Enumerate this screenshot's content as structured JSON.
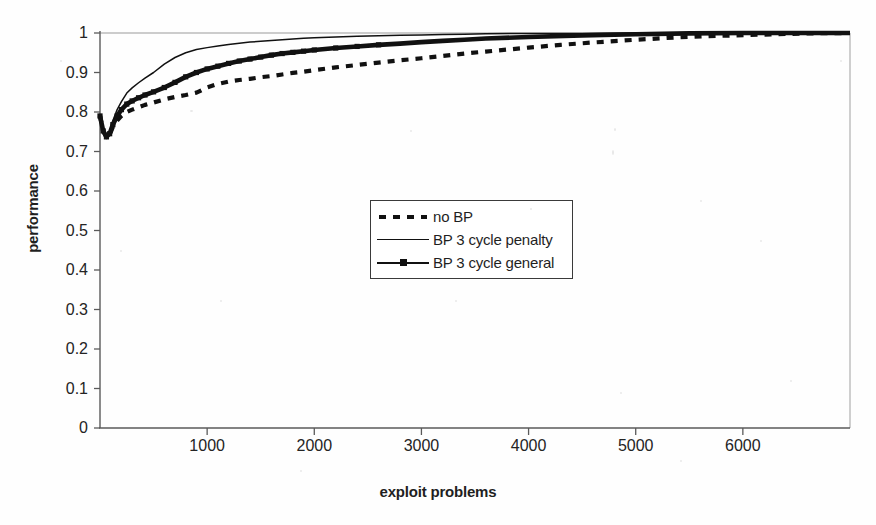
{
  "chart_data": {
    "type": "line",
    "title": "",
    "subtitle": "",
    "xlabel": "exploit problems",
    "ylabel": "performance",
    "xlim": [
      0,
      7000
    ],
    "ylim": [
      0,
      1
    ],
    "xticks": [
      1000,
      2000,
      3000,
      4000,
      5000,
      6000
    ],
    "xtick_labels": [
      "1000",
      "2000",
      "3000",
      "4000",
      "5000",
      "6000"
    ],
    "yticks": [
      0,
      0.1,
      0.2,
      0.3,
      0.4,
      0.5,
      0.6,
      0.7,
      0.8,
      0.9,
      1
    ],
    "ytick_labels": [
      "0",
      "0.1",
      "0.2",
      "0.3",
      "0.4",
      "0.5",
      "0.6",
      "0.7",
      "0.8",
      "0.9",
      "1"
    ],
    "grid": false,
    "legend_position": "center",
    "legend_entries": [
      "no BP",
      "BP 3 cycle penalty",
      "BP 3 cycle general"
    ],
    "series": [
      {
        "name": "no BP",
        "style": "dashed",
        "color": "#111111",
        "x": [
          0,
          30,
          60,
          90,
          120,
          160,
          200,
          250,
          300,
          360,
          420,
          500,
          600,
          700,
          800,
          900,
          1000,
          1100,
          1200,
          1300,
          1400,
          1500,
          1600,
          1700,
          1800,
          1900,
          2000,
          2200,
          2400,
          2600,
          2800,
          3000,
          3200,
          3400,
          3600,
          3800,
          4000,
          4300,
          4600,
          5000,
          5400,
          5800,
          6200,
          6600,
          7000
        ],
        "y": [
          0.79,
          0.752,
          0.737,
          0.742,
          0.762,
          0.778,
          0.79,
          0.8,
          0.806,
          0.812,
          0.818,
          0.824,
          0.832,
          0.838,
          0.843,
          0.849,
          0.862,
          0.871,
          0.877,
          0.881,
          0.884,
          0.888,
          0.891,
          0.895,
          0.899,
          0.902,
          0.906,
          0.913,
          0.919,
          0.925,
          0.931,
          0.936,
          0.942,
          0.948,
          0.953,
          0.958,
          0.963,
          0.97,
          0.976,
          0.983,
          0.989,
          0.993,
          0.996,
          0.999,
          1.0
        ]
      },
      {
        "name": "BP 3 cycle penalty",
        "style": "solid-thin",
        "color": "#111111",
        "x": [
          0,
          30,
          60,
          90,
          120,
          160,
          200,
          250,
          300,
          360,
          420,
          500,
          600,
          700,
          800,
          900,
          1000,
          1100,
          1200,
          1300,
          1400,
          1500,
          1600,
          1700,
          1800,
          1900,
          2000,
          2200,
          2400,
          2600,
          2800,
          3000,
          3200,
          3400,
          3600,
          4000,
          4500,
          5000,
          5500,
          6000,
          6500,
          7000
        ],
        "y": [
          0.79,
          0.755,
          0.74,
          0.752,
          0.778,
          0.806,
          0.826,
          0.848,
          0.861,
          0.874,
          0.886,
          0.9,
          0.921,
          0.938,
          0.95,
          0.958,
          0.963,
          0.967,
          0.971,
          0.974,
          0.977,
          0.979,
          0.981,
          0.983,
          0.985,
          0.987,
          0.988,
          0.99,
          0.992,
          0.993,
          0.994,
          0.995,
          0.996,
          0.997,
          0.998,
          0.999,
          0.999,
          1.0,
          1.0,
          1.0,
          1.0,
          1.0
        ]
      },
      {
        "name": "BP 3 cycle general",
        "style": "solid-marker",
        "color": "#111111",
        "x": [
          0,
          30,
          60,
          90,
          120,
          160,
          200,
          250,
          300,
          360,
          420,
          500,
          600,
          700,
          800,
          900,
          1000,
          1100,
          1200,
          1300,
          1400,
          1500,
          1600,
          1700,
          1800,
          1900,
          2000,
          2200,
          2400,
          2600,
          2800,
          3000,
          3200,
          3400,
          3600,
          4000,
          4500,
          5000,
          5500,
          6000,
          6500,
          7000
        ],
        "y": [
          0.79,
          0.752,
          0.737,
          0.745,
          0.768,
          0.79,
          0.806,
          0.82,
          0.828,
          0.836,
          0.843,
          0.851,
          0.862,
          0.875,
          0.889,
          0.9,
          0.909,
          0.916,
          0.923,
          0.929,
          0.934,
          0.939,
          0.944,
          0.948,
          0.951,
          0.954,
          0.957,
          0.962,
          0.966,
          0.97,
          0.973,
          0.977,
          0.98,
          0.983,
          0.986,
          0.99,
          0.994,
          0.997,
          0.999,
          1.0,
          1.0,
          1.0
        ]
      }
    ]
  },
  "axes": {
    "xlabel": "exploit problems",
    "ylabel": "performance"
  },
  "legend": {
    "items": [
      {
        "label": "no BP",
        "style": "dashed"
      },
      {
        "label": "BP 3 cycle penalty",
        "style": "solid"
      },
      {
        "label": "BP 3 cycle general",
        "style": "solid-marker"
      }
    ]
  },
  "colors": {
    "line": "#111111",
    "axis": "#555555",
    "text": "#1f1f1f",
    "background": "#ffffff"
  }
}
